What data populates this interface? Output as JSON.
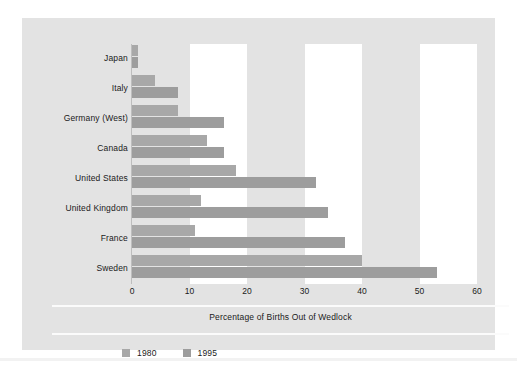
{
  "chart_data": {
    "type": "bar",
    "orientation": "horizontal",
    "title": "",
    "subtitle": "",
    "xlabel": "Percentage of Births Out of Wedlock",
    "ylabel": "",
    "xlim": [
      0,
      60
    ],
    "xticks": [
      0,
      10,
      20,
      30,
      40,
      50,
      60
    ],
    "xtick_labels": [
      "0",
      "10",
      "20",
      "30",
      "40",
      "50",
      "60"
    ],
    "grid": false,
    "banding": "alternating white vertical bands at 10-20, 30-40, 50-60",
    "legend_position": "bottom-left",
    "categories": [
      "Japan",
      "Italy",
      "Germany (West)",
      "Canada",
      "United States",
      "United Kingdom",
      "France",
      "Sweden"
    ],
    "series": [
      {
        "name": "1980",
        "color": "#a8a8a8",
        "values": [
          1,
          4,
          8,
          13,
          18,
          12,
          11,
          40
        ]
      },
      {
        "name": "1995",
        "color": "#9d9d9d",
        "values": [
          1,
          8,
          16,
          16,
          32,
          34,
          37,
          53
        ]
      }
    ]
  },
  "legend": {
    "items": [
      {
        "label": "1980",
        "color": "#a8a8a8"
      },
      {
        "label": "1995",
        "color": "#9d9d9d"
      }
    ]
  },
  "axis": {
    "title": "Percentage of Births Out of Wedlock",
    "ticks": [
      "0",
      "10",
      "20",
      "30",
      "40",
      "50",
      "60"
    ]
  },
  "colors": {
    "panel": "#e3e3e3",
    "band": "#ffffff",
    "bar_1980": "#a8a8a8",
    "bar_1995": "#9d9d9d",
    "text": "#1a1a1a",
    "separator": "#fbfbfb"
  }
}
